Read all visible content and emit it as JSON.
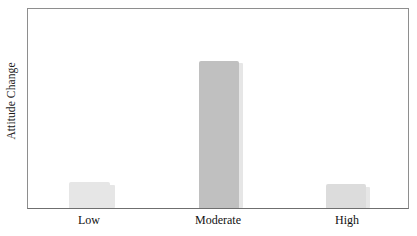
{
  "chart_data": {
    "type": "bar",
    "title": "",
    "subtitle": "",
    "xlabel": "",
    "ylabel": "Attitude Change",
    "categories": [
      "Low",
      "Moderate",
      "High"
    ],
    "values": [
      13,
      74,
      12
    ],
    "ylim": [
      0,
      100
    ],
    "axis_ticks_shown": false,
    "grid": false,
    "legend": null,
    "annotations": [],
    "series": [
      {
        "name": "Attitude Change",
        "values": [
          13,
          74,
          12
        ]
      }
    ],
    "bar_colors": [
      "#e6e6e6",
      "#c0c0c0",
      "#dcdcdc"
    ],
    "bar_geometry": [
      {
        "category": "Low",
        "left_pct": 10.7,
        "width_pct": 11.0,
        "height_pct": 13.0
      },
      {
        "category": "Moderate",
        "left_pct": 45.0,
        "width_pct": 10.5,
        "height_pct": 74.0
      },
      {
        "category": "High",
        "left_pct": 78.5,
        "width_pct": 10.5,
        "height_pct": 12.0
      }
    ],
    "tick_positions_px": [
      89,
      218,
      347
    ]
  },
  "style": {
    "frame_color": "#8e8e8e",
    "baseline_color": "#6f6f6f",
    "background": "#ffffff",
    "text_color": "#111111"
  }
}
